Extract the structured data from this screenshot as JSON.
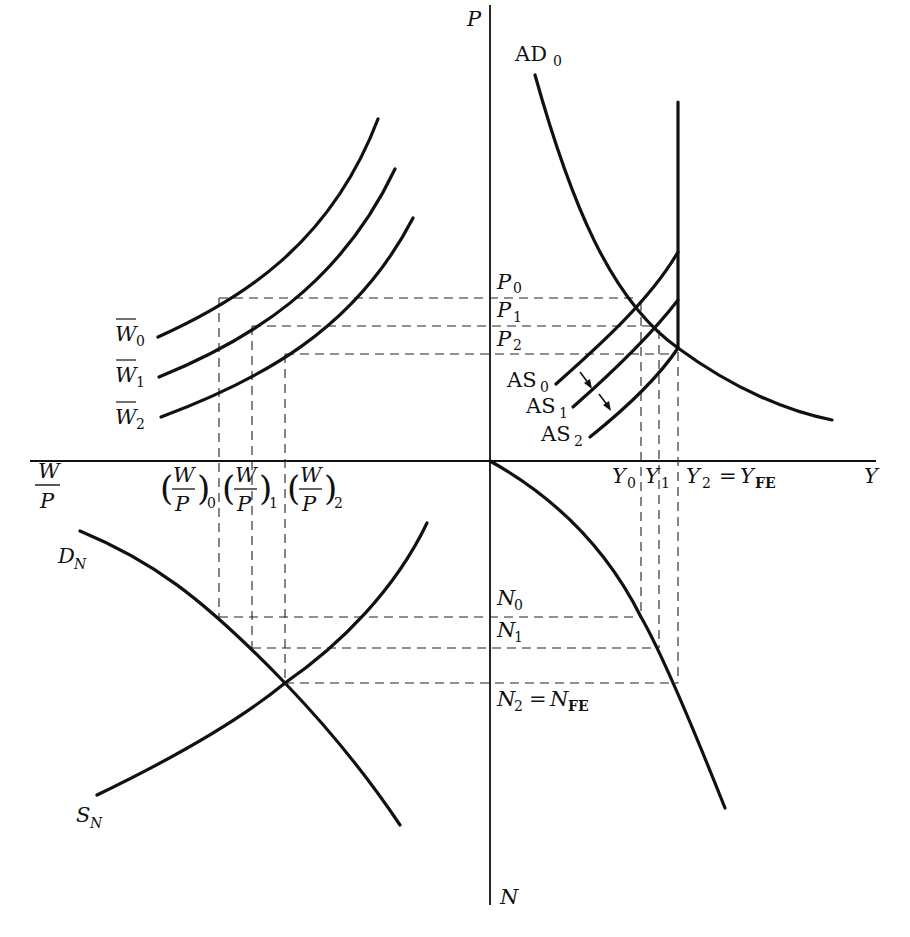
{
  "figure": {
    "axes": {
      "vertical_top": "P",
      "vertical_bottom": "N",
      "horizontal_right": "Y",
      "horizontal_left_num": "W",
      "horizontal_left_den": "P"
    },
    "quadrant_ne": {
      "curves": {
        "ad": {
          "base": "AD",
          "sub": "0"
        },
        "as0": {
          "base": "AS",
          "sub": "0"
        },
        "as1": {
          "base": "AS",
          "sub": "1"
        },
        "as2": {
          "base": "AS",
          "sub": "2"
        }
      },
      "price_levels": [
        {
          "base": "P",
          "sub": "0"
        },
        {
          "base": "P",
          "sub": "1"
        },
        {
          "base": "P",
          "sub": "2"
        }
      ],
      "output_levels": [
        {
          "base": "Y",
          "sub": "0"
        },
        {
          "base": "Y",
          "sub": "1"
        },
        {
          "base": "Y",
          "sub": "2",
          "eq": "=",
          "eq_base": "Y",
          "eq_sub": "FE"
        }
      ]
    },
    "quadrant_nw": {
      "wage_curves": [
        {
          "base": "W",
          "sub": "0",
          "overbar": true
        },
        {
          "base": "W",
          "sub": "1",
          "overbar": true
        },
        {
          "base": "W",
          "sub": "2",
          "overbar": true
        }
      ],
      "real_wages": [
        {
          "num": "W",
          "den": "P",
          "sub": "0"
        },
        {
          "num": "W",
          "den": "P",
          "sub": "1"
        },
        {
          "num": "W",
          "den": "P",
          "sub": "2"
        }
      ]
    },
    "quadrant_sw": {
      "demand": {
        "base": "D",
        "sub": "N"
      },
      "supply": {
        "base": "S",
        "sub": "N"
      }
    },
    "quadrant_se": {
      "employment_levels": [
        {
          "base": "N",
          "sub": "0"
        },
        {
          "base": "N",
          "sub": "1"
        },
        {
          "base": "N",
          "sub": "2",
          "eq": "=",
          "eq_base": "N",
          "eq_sub": "FE"
        }
      ]
    },
    "colors": {
      "ink": "#111111",
      "background": "#ffffff"
    }
  }
}
